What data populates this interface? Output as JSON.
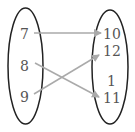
{
  "diagram": {
    "type": "mapping",
    "domain_set": [
      "7",
      "8",
      "9"
    ],
    "codomain_set": [
      "10",
      "12",
      "1",
      "11"
    ],
    "arrows": [
      {
        "from": "7",
        "to": "10"
      },
      {
        "from": "8",
        "to": "11"
      },
      {
        "from": "9",
        "to": "12"
      }
    ],
    "colors": {
      "ellipse": "#222222",
      "arrow": "#aaaaaa",
      "text": "#555555"
    }
  }
}
